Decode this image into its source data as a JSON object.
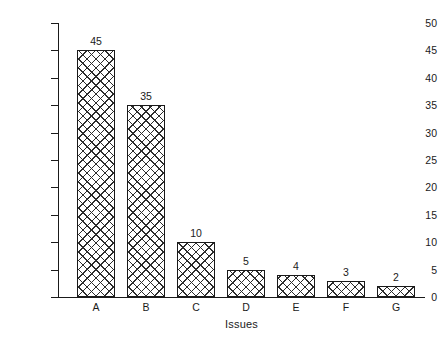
{
  "chart_data": {
    "type": "bar",
    "title": "",
    "subtitle": "",
    "xlabel": "Issues",
    "ylabel": "Vote Count",
    "categories": [
      "A",
      "B",
      "C",
      "D",
      "E",
      "F",
      "G"
    ],
    "values": [
      45,
      35,
      10,
      5,
      4,
      3,
      2
    ],
    "value_labels": [
      "45",
      "35",
      "10",
      "5",
      "4",
      "3",
      "2"
    ],
    "ylim": [
      0,
      50
    ],
    "ytick_labels": [
      "0",
      "5",
      "10",
      "15",
      "20",
      "25",
      "30",
      "35",
      "40",
      "45",
      "50"
    ],
    "ytick_values": [
      0,
      5,
      10,
      15,
      20,
      25,
      30,
      35,
      40,
      45,
      50
    ],
    "grid": false,
    "legend": null,
    "legend_position": "none",
    "bar_fill_pattern": "crosshatch",
    "bar_edge_color": "#1a1a1a",
    "bar_face_color": "#ffffff",
    "background_color": "#ffffff",
    "axis_color": "#1a1a1a"
  }
}
